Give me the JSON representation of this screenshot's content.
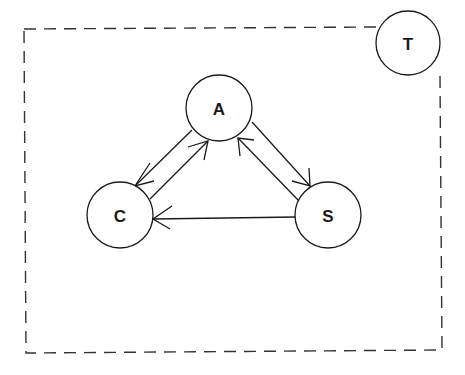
{
  "diagram": {
    "type": "state-transition",
    "boundary": {
      "style": "dashed",
      "x1": 24,
      "y1": 28,
      "x2": 442,
      "y2": 352
    },
    "nodes": [
      {
        "id": "A",
        "label": "A",
        "cx": 219,
        "cy": 108,
        "r": 33
      },
      {
        "id": "C",
        "label": "C",
        "cx": 120,
        "cy": 215,
        "r": 33
      },
      {
        "id": "S",
        "label": "S",
        "cx": 328,
        "cy": 215,
        "r": 33
      },
      {
        "id": "T",
        "label": "T",
        "cx": 408,
        "cy": 43,
        "r": 32
      }
    ],
    "edges": [
      {
        "from": "A",
        "to": "C"
      },
      {
        "from": "C",
        "to": "A"
      },
      {
        "from": "A",
        "to": "S"
      },
      {
        "from": "S",
        "to": "A"
      },
      {
        "from": "S",
        "to": "C"
      }
    ],
    "colors": {
      "stroke": "#1a1a1a",
      "background": "#ffffff"
    }
  }
}
